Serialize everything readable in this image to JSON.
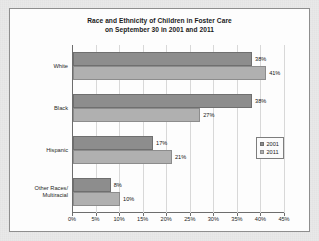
{
  "chart_data": {
    "type": "bar",
    "orientation": "horizontal",
    "title": "Race and Ethnicity of Children in Foster Care on September 30 in 2001 and 2011",
    "title_line1": "Race and Ethnicity of Children in Foster Care",
    "title_line2": "on September 30 in 2001 and 2011",
    "categories": [
      "White",
      "Black",
      "Hispanic",
      "Other Races/Multiracial"
    ],
    "category_labels": [
      [
        "White"
      ],
      [
        "Black"
      ],
      [
        "Hispanic"
      ],
      [
        "Other Races/",
        "Multiracial"
      ]
    ],
    "series": [
      {
        "name": "2001",
        "color": "#8d8d8d",
        "values": [
          38,
          38,
          17,
          8
        ],
        "value_labels": [
          "38%",
          "38%",
          "17%",
          "8%"
        ]
      },
      {
        "name": "2011",
        "color": "#b0b0b0",
        "values": [
          41,
          27,
          21,
          10
        ],
        "value_labels": [
          "41%",
          "27%",
          "21%",
          "10%"
        ]
      }
    ],
    "xlabel": "",
    "ylabel": "",
    "xlim": [
      0,
      45
    ],
    "xticks": [
      0,
      5,
      10,
      15,
      20,
      25,
      30,
      35,
      40,
      45
    ],
    "xtick_labels": [
      "0%",
      "5%",
      "10%",
      "15%",
      "20%",
      "25%",
      "30%",
      "35%",
      "40%",
      "45%"
    ],
    "grid": true,
    "legend_position": "right-middle",
    "legend_entries": [
      "2001",
      "2011"
    ]
  }
}
